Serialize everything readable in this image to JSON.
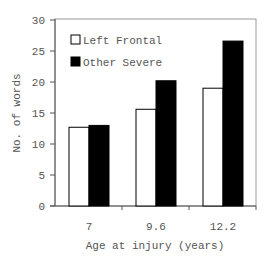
{
  "chart_data": {
    "type": "bar",
    "title": "",
    "xlabel": "Age at injury (years)",
    "ylabel": "No. of words",
    "categories": [
      "7",
      "9.6",
      "12.2"
    ],
    "series": [
      {
        "name": "Left Frontal",
        "color": "#ffffff",
        "values": [
          12.7,
          15.6,
          19.0
        ]
      },
      {
        "name": "Other Severe",
        "color": "#000000",
        "values": [
          13.0,
          20.2,
          26.6
        ]
      }
    ],
    "ylim": [
      0,
      30
    ],
    "yticks": [
      0,
      5,
      10,
      15,
      20,
      25,
      30
    ],
    "grid": false,
    "legend_position": "upper-left-inside"
  },
  "axes": {
    "ylabel": "No. of words",
    "xlabel": "Age at injury (years)",
    "yticks": [
      "0",
      "5",
      "10",
      "15",
      "20",
      "25",
      "30"
    ],
    "xticks": [
      "7",
      "9.6",
      "12.2"
    ]
  },
  "legend": {
    "items": [
      {
        "label": "Left Frontal",
        "swatch": "white"
      },
      {
        "label": "Other Severe",
        "swatch": "black"
      }
    ]
  }
}
